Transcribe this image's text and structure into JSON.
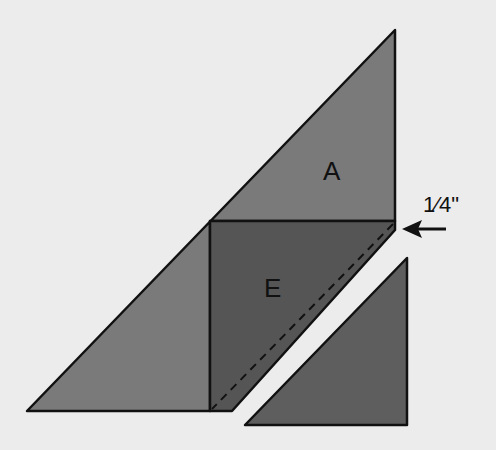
{
  "diagram": {
    "labels": {
      "piece_a": "A",
      "piece_e": "E",
      "measurement": "1⁄4\""
    },
    "colors": {
      "background": "#ececec",
      "piece_a": "#7a7a7a",
      "piece_e": "#555555",
      "cut_piece": "#5e5e5e",
      "outline": "#111111"
    }
  }
}
